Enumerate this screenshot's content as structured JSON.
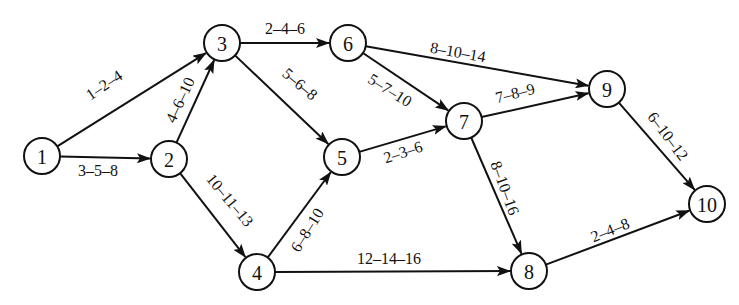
{
  "diagram": {
    "type": "activity-on-arrow network (PERT)",
    "label_format": "optimistic-most likely-pessimistic",
    "style": {
      "line_color": "#111111",
      "background": "#ffffff",
      "node_radius": 18
    },
    "nodes": [
      {
        "id": "1",
        "label": "1",
        "x": 42,
        "y": 156
      },
      {
        "id": "2",
        "label": "2",
        "x": 169,
        "y": 159
      },
      {
        "id": "3",
        "label": "3",
        "x": 222,
        "y": 43
      },
      {
        "id": "4",
        "label": "4",
        "x": 257,
        "y": 272
      },
      {
        "id": "5",
        "label": "5",
        "x": 342,
        "y": 157
      },
      {
        "id": "6",
        "label": "6",
        "x": 348,
        "y": 43
      },
      {
        "id": "7",
        "label": "7",
        "x": 464,
        "y": 121
      },
      {
        "id": "8",
        "label": "8",
        "x": 529,
        "y": 271
      },
      {
        "id": "9",
        "label": "9",
        "x": 607,
        "y": 89
      },
      {
        "id": "10",
        "label": "10",
        "x": 707,
        "y": 204
      }
    ],
    "edges": [
      {
        "from": "1",
        "to": "3",
        "label": "1–2–4",
        "label_x": 104,
        "label_y": 85,
        "label_angle": -34,
        "label_side": "above"
      },
      {
        "from": "1",
        "to": "2",
        "label": "3–5–8",
        "label_x": 98,
        "label_y": 170,
        "label_angle": 0,
        "label_side": "below"
      },
      {
        "from": "2",
        "to": "3",
        "label": "4–6–10",
        "label_x": 180,
        "label_y": 100,
        "label_angle": -65,
        "label_side": "left"
      },
      {
        "from": "3",
        "to": "6",
        "label": "2–4–6",
        "label_x": 285,
        "label_y": 28,
        "label_angle": 0,
        "label_side": "above"
      },
      {
        "from": "3",
        "to": "5",
        "label": "5–6–8",
        "label_x": 300,
        "label_y": 84,
        "label_angle": 40,
        "label_side": "right"
      },
      {
        "from": "2",
        "to": "4",
        "label": "10–11–13",
        "label_x": 230,
        "label_y": 200,
        "label_angle": 50,
        "label_side": "right"
      },
      {
        "from": "4",
        "to": "5",
        "label": "6–8–10",
        "label_x": 307,
        "label_y": 230,
        "label_angle": -58,
        "label_side": "right"
      },
      {
        "from": "4",
        "to": "8",
        "label": "12–14–16",
        "label_x": 389,
        "label_y": 258,
        "label_angle": 0,
        "label_side": "above"
      },
      {
        "from": "5",
        "to": "7",
        "label": "2–3–6",
        "label_x": 403,
        "label_y": 152,
        "label_angle": -18,
        "label_side": "below"
      },
      {
        "from": "6",
        "to": "7",
        "label": "5–7–10",
        "label_x": 390,
        "label_y": 90,
        "label_angle": 32,
        "label_side": "below"
      },
      {
        "from": "6",
        "to": "9",
        "label": "8–10–14",
        "label_x": 458,
        "label_y": 52,
        "label_angle": 10,
        "label_side": "above"
      },
      {
        "from": "7",
        "to": "9",
        "label": "7–8–9",
        "label_x": 515,
        "label_y": 93,
        "label_angle": -14,
        "label_side": "above"
      },
      {
        "from": "7",
        "to": "8",
        "label": "8–10–16",
        "label_x": 505,
        "label_y": 188,
        "label_angle": 70,
        "label_side": "right"
      },
      {
        "from": "8",
        "to": "10",
        "label": "2–4–8",
        "label_x": 610,
        "label_y": 230,
        "label_angle": -22,
        "label_side": "above"
      },
      {
        "from": "9",
        "to": "10",
        "label": "6–10–12",
        "label_x": 668,
        "label_y": 136,
        "label_angle": 53,
        "label_side": "right"
      }
    ]
  }
}
